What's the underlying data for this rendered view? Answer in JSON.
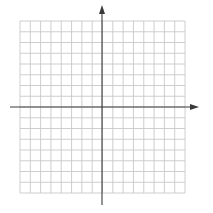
{
  "graph": {
    "type": "coordinate-plane",
    "grid": {
      "columns": 16,
      "rows": 16,
      "left": 20,
      "top": 21,
      "right": 185,
      "bottom": 193,
      "line_color": "#c8c8c8",
      "line_width": 0.9
    },
    "axes": {
      "color": "#3a3a3a",
      "width": 1.1,
      "x_axis": {
        "y": 107,
        "x_start": 10,
        "x_end": 199,
        "arrow": "right"
      },
      "y_axis": {
        "x": 102,
        "y_start": 205,
        "y_end": 5,
        "arrow": "up"
      }
    }
  }
}
